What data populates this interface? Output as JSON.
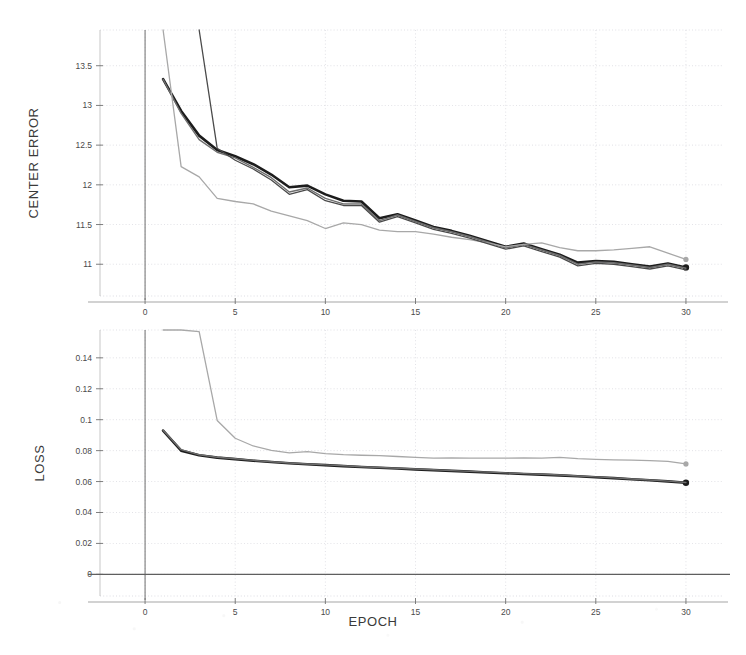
{
  "figure": {
    "xlabel": "EPOCH",
    "style": {
      "background": "#ffffff",
      "grid_color": "#d9d9e0",
      "axis_color": "#8a8a8a",
      "series_dark": "#1c1c1c",
      "series_mid": "#6e6e6e",
      "series_light": "#a8a8a8"
    }
  },
  "chart_data": [
    {
      "type": "line",
      "title": "",
      "ylabel": "CENTER ERROR",
      "xlabel": "EPOCH",
      "xlim": [
        -2.5,
        32
      ],
      "ylim": [
        10.6,
        13.95
      ],
      "xticks": [
        0,
        5,
        10,
        15,
        20,
        25,
        30
      ],
      "xticklabels": [
        "0",
        "5",
        "10",
        "15",
        "20",
        "25",
        "30"
      ],
      "yticks": [
        11,
        11.5,
        12,
        12.5,
        13,
        13.5
      ],
      "yticklabels": [
        "11",
        "11.5",
        "12",
        "12.5",
        "13",
        "13.5"
      ],
      "grid": true,
      "legend": "none",
      "x": [
        1,
        2,
        3,
        4,
        5,
        6,
        7,
        8,
        9,
        10,
        11,
        12,
        13,
        14,
        15,
        16,
        17,
        18,
        19,
        20,
        21,
        22,
        23,
        24,
        25,
        26,
        27,
        28,
        29,
        30
      ],
      "series": [
        {
          "name": "series-dark",
          "color": "#1c1c1c",
          "width": 2.6,
          "marker_at_end": true,
          "values": [
            13.33,
            12.93,
            12.62,
            12.44,
            12.36,
            12.26,
            12.13,
            11.97,
            11.99,
            11.88,
            11.8,
            11.79,
            11.58,
            11.63,
            11.55,
            11.47,
            11.42,
            11.36,
            11.29,
            11.22,
            11.26,
            11.19,
            11.12,
            11.02,
            11.04,
            11.03,
            11.0,
            10.97,
            11.01,
            10.96
          ]
        },
        {
          "name": "series-mid",
          "color": "#6e6e6e",
          "width": 1.4,
          "marker_at_end": false,
          "values": [
            13.33,
            12.9,
            12.57,
            12.41,
            12.34,
            12.22,
            12.09,
            11.91,
            11.96,
            11.83,
            11.76,
            11.76,
            11.55,
            11.62,
            11.54,
            11.46,
            11.41,
            11.35,
            11.28,
            11.21,
            11.25,
            11.18,
            11.11,
            11.0,
            11.03,
            11.02,
            10.99,
            10.96,
            11.0,
            10.95
          ]
        },
        {
          "name": "series-light",
          "color": "#a8a8a8",
          "width": 1.3,
          "marker_at_end": true,
          "values": [
            13.95,
            12.23,
            12.1,
            11.83,
            11.79,
            11.76,
            11.67,
            11.61,
            11.55,
            11.45,
            11.52,
            11.5,
            11.43,
            11.41,
            11.41,
            11.38,
            11.34,
            11.31,
            11.27,
            11.22,
            11.25,
            11.27,
            11.21,
            11.17,
            11.17,
            11.18,
            11.2,
            11.22,
            11.14,
            11.06
          ]
        },
        {
          "name": "series-steep-overlay",
          "color": "#4a4a4a",
          "width": 1.3,
          "marker_at_end": false,
          "values": [
            null,
            null,
            13.95,
            12.46,
            12.31,
            12.2,
            12.06,
            11.88,
            11.94,
            11.8,
            11.74,
            11.74,
            11.53,
            11.6,
            11.52,
            11.44,
            11.39,
            11.33,
            11.26,
            11.19,
            11.23,
            11.16,
            11.09,
            10.98,
            11.01,
            11.0,
            10.97,
            10.94,
            10.98,
            10.93
          ]
        }
      ]
    },
    {
      "type": "line",
      "title": "",
      "ylabel": "LOSS",
      "xlabel": "EPOCH",
      "xlim": [
        -2.5,
        32
      ],
      "ylim": [
        -0.014,
        0.158
      ],
      "xticks": [
        0,
        5,
        10,
        15,
        20,
        25,
        30
      ],
      "xticklabels": [
        "0",
        "5",
        "10",
        "15",
        "20",
        "25",
        "30"
      ],
      "yticks": [
        0,
        0.02,
        0.04,
        0.06,
        0.08,
        0.1,
        0.12,
        0.14
      ],
      "yticklabels": [
        "0",
        "0.02",
        "0.04",
        "0.06",
        "0.08",
        "0.1",
        "0.12",
        "0.14"
      ],
      "grid": true,
      "legend": "none",
      "x": [
        1,
        2,
        3,
        4,
        5,
        6,
        7,
        8,
        9,
        10,
        11,
        12,
        13,
        14,
        15,
        16,
        17,
        18,
        19,
        20,
        21,
        22,
        23,
        24,
        25,
        26,
        27,
        28,
        29,
        30
      ],
      "series": [
        {
          "name": "series-dark",
          "color": "#1c1c1c",
          "width": 2.6,
          "marker_at_end": true,
          "values": [
            0.093,
            0.08,
            0.077,
            0.0755,
            0.0745,
            0.0735,
            0.0726,
            0.0718,
            0.0712,
            0.0706,
            0.07,
            0.0694,
            0.0689,
            0.0684,
            0.0679,
            0.0674,
            0.0669,
            0.0664,
            0.0659,
            0.0654,
            0.0649,
            0.0645,
            0.064,
            0.0634,
            0.0628,
            0.0622,
            0.0615,
            0.0608,
            0.0601,
            0.0592
          ]
        },
        {
          "name": "series-mid",
          "color": "#6e6e6e",
          "width": 1.4,
          "marker_at_end": false,
          "values": [
            0.0932,
            0.0806,
            0.0773,
            0.0757,
            0.0747,
            0.0737,
            0.0728,
            0.072,
            0.0714,
            0.0708,
            0.0702,
            0.0696,
            0.0691,
            0.0686,
            0.0681,
            0.0676,
            0.0671,
            0.0666,
            0.0661,
            0.0656,
            0.0651,
            0.0647,
            0.0642,
            0.0636,
            0.063,
            0.0624,
            0.0617,
            0.061,
            0.0603,
            0.0594
          ]
        },
        {
          "name": "series-light",
          "color": "#a8a8a8",
          "width": 1.3,
          "marker_at_end": true,
          "values": [
            0.158,
            0.158,
            0.157,
            0.0995,
            0.088,
            0.083,
            0.0802,
            0.0786,
            0.0793,
            0.0781,
            0.0774,
            0.077,
            0.0768,
            0.0762,
            0.0757,
            0.0751,
            0.0753,
            0.0752,
            0.0752,
            0.0751,
            0.0753,
            0.0751,
            0.0756,
            0.0748,
            0.0743,
            0.074,
            0.0738,
            0.0735,
            0.0731,
            0.0714
          ]
        }
      ]
    }
  ]
}
